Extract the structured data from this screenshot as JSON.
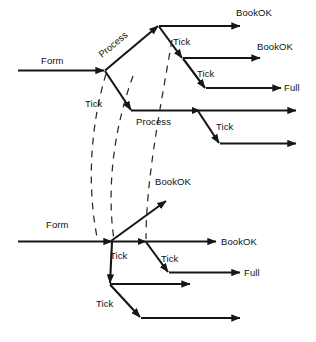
{
  "diagram": {
    "canvas": {
      "width": 316,
      "height": 342,
      "background": "#ffffff"
    },
    "colors": {
      "stroke": "#161616",
      "dashed_stroke": "#2a2a2a",
      "text": "#101010",
      "background": "#ffffff"
    },
    "labels": {
      "form_upper": "Form",
      "process_upper": "Process",
      "tick_upper_left": "Tick",
      "tick_upper_right_1": "Tick",
      "tick_upper_right_2": "Tick",
      "process_middle": "Process",
      "tick_middle_right": "Tick",
      "bookok_top": "BookOK",
      "bookok_second": "BookOK",
      "full_upper": "Full",
      "bookok_lower_diagonal": "BookOK",
      "form_lower": "Form",
      "tick_lower_left": "Tick",
      "tick_lower_middle": "Tick",
      "tick_lower_bottom": "Tick",
      "bookok_lower": "BookOK",
      "full_lower": "Full"
    }
  }
}
